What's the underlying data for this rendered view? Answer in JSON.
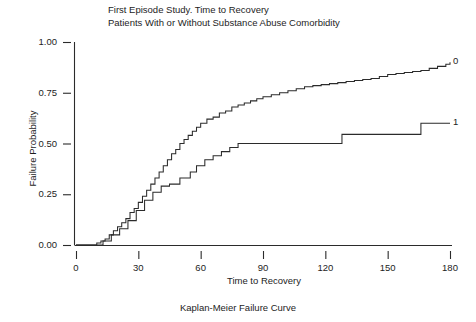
{
  "figure": {
    "title_lines": [
      "First Episode Study. Time to Recovery",
      "Patients With or Without Substance Abuse Comorbidity"
    ],
    "caption": "Kaplan-Meier Failure Curve"
  },
  "chart_data": {
    "type": "line",
    "title": "First Episode Study. Time to Recovery Patients With or Without Substance Abuse Comorbidity",
    "subtitle": "Kaplan-Meier Failure Curve",
    "xlabel": "Time to Recovery",
    "ylabel": "Failure Probability",
    "xlim": [
      0,
      180
    ],
    "ylim": [
      0.0,
      1.0
    ],
    "xticks": [
      0,
      30,
      60,
      90,
      120,
      150,
      180
    ],
    "xtick_labels": [
      "0",
      "30",
      "60",
      "90",
      "120",
      "150",
      "180"
    ],
    "yticks": [
      0.0,
      0.25,
      0.5,
      0.75,
      1.0
    ],
    "ytick_labels": [
      "0.00",
      "0.25",
      "0.50",
      "0.75",
      "1.00"
    ],
    "grid": false,
    "legend_position": "end-of-line-labels",
    "step_style": "post",
    "series": [
      {
        "name": "0",
        "end_label": "0",
        "end_label_x": 180,
        "end_label_y": 0.9,
        "x": [
          0,
          8,
          10,
          12,
          14,
          16,
          18,
          20,
          22,
          24,
          26,
          28,
          30,
          32,
          34,
          36,
          38,
          40,
          42,
          44,
          46,
          48,
          50,
          52,
          54,
          56,
          58,
          60,
          63,
          66,
          69,
          72,
          75,
          78,
          81,
          84,
          87,
          90,
          94,
          98,
          102,
          106,
          110,
          114,
          118,
          122,
          126,
          130,
          134,
          138,
          142,
          146,
          150,
          154,
          158,
          162,
          166,
          170,
          174,
          178,
          180
        ],
        "y": [
          0.0,
          0.0,
          0.01,
          0.02,
          0.03,
          0.05,
          0.07,
          0.09,
          0.11,
          0.13,
          0.16,
          0.18,
          0.21,
          0.24,
          0.27,
          0.3,
          0.33,
          0.36,
          0.39,
          0.42,
          0.45,
          0.47,
          0.5,
          0.52,
          0.54,
          0.56,
          0.58,
          0.6,
          0.62,
          0.63,
          0.65,
          0.66,
          0.68,
          0.69,
          0.7,
          0.71,
          0.72,
          0.73,
          0.74,
          0.75,
          0.76,
          0.77,
          0.78,
          0.785,
          0.79,
          0.795,
          0.8,
          0.805,
          0.81,
          0.815,
          0.82,
          0.83,
          0.84,
          0.845,
          0.85,
          0.855,
          0.86,
          0.87,
          0.88,
          0.89,
          0.9
        ]
      },
      {
        "name": "1",
        "end_label": "1",
        "end_label_x": 180,
        "end_label_y": 0.6,
        "x": [
          0,
          9,
          13,
          17,
          21,
          25,
          29,
          33,
          37,
          41,
          45,
          50,
          55,
          58,
          62,
          66,
          70,
          74,
          78,
          128,
          166,
          180
        ],
        "y": [
          0.0,
          0.0,
          0.02,
          0.05,
          0.08,
          0.12,
          0.17,
          0.22,
          0.26,
          0.29,
          0.3,
          0.33,
          0.36,
          0.39,
          0.42,
          0.44,
          0.46,
          0.48,
          0.5,
          0.545,
          0.6,
          0.6
        ]
      }
    ]
  }
}
